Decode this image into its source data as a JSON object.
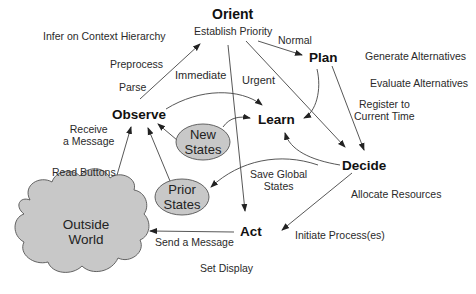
{
  "nodes": {
    "orient": "Orient",
    "plan": "Plan",
    "observe": "Observe",
    "learn": "Learn",
    "decide": "Decide",
    "act": "Act"
  },
  "states": {
    "new_line1": "New",
    "new_line2": "States",
    "prior_line1": "Prior",
    "prior_line2": "States"
  },
  "outside_world": {
    "line1": "Outside",
    "line2": "World"
  },
  "labels": {
    "infer": "Infer on Context Hierarchy",
    "establish": "Establish Priority",
    "normal": "Normal",
    "preprocess": "Preprocess",
    "parse": "Parse",
    "immediate": "Immediate",
    "urgent": "Urgent",
    "generate": "Generate Alternatives",
    "evaluate": "Evaluate Alternatives",
    "register1": "Register to",
    "register2": "Current Time",
    "receive1": "Receive",
    "receive2": "a Message",
    "read_buttons": "Read Buttons",
    "save1": "Save Global",
    "save2": "States",
    "allocate": "Allocate Resources",
    "send": "Send a Message",
    "initiate": "Initiate Process(es)",
    "set_display": "Set Display"
  },
  "colors": {
    "shape_fill": "#c8c8c8",
    "line": "#333333"
  }
}
